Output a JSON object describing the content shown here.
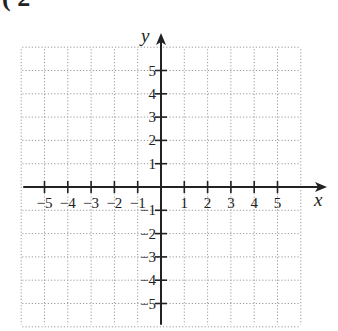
{
  "header": {
    "partial_text": "( 2"
  },
  "chart_data": {
    "type": "coordinate-grid",
    "title": "",
    "xlabel": "x",
    "ylabel": "y",
    "xlim": [
      -6,
      6
    ],
    "ylim": [
      -6,
      6
    ],
    "grid": true,
    "grid_style": "dotted",
    "x_ticks": [
      -5,
      -4,
      -3,
      -2,
      -1,
      1,
      2,
      3,
      4,
      5
    ],
    "y_ticks": [
      5,
      4,
      3,
      2,
      1,
      -1,
      -2,
      -3,
      -4,
      -5
    ],
    "x_tick_labels": [
      "−5",
      "−4",
      "−3",
      "−2",
      "−1",
      "1",
      "2",
      "3",
      "4",
      "5"
    ],
    "y_tick_labels": [
      "5",
      "4",
      "3",
      "2",
      "1",
      "−1",
      "−2",
      "−3",
      "−4",
      "−5"
    ],
    "series": []
  },
  "colors": {
    "axis": "#222222",
    "grid": "#9a9a9a",
    "background": "#ffffff"
  }
}
